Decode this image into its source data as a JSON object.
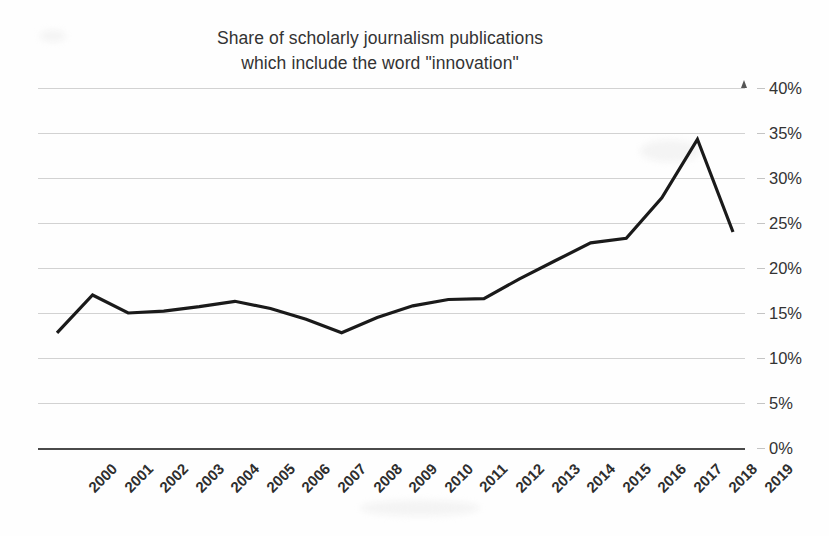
{
  "chart_data": {
    "type": "line",
    "title": "Share of scholarly journalism publications which include the word \"innovation\"",
    "title_lines": [
      "Share of scholarly journalism publications",
      "which include the word \"innovation\""
    ],
    "xlabel": "",
    "ylabel": "",
    "ylim": [
      0,
      40
    ],
    "ytick_labels": [
      "40%",
      "35%",
      "30%",
      "25%",
      "20%",
      "15%",
      "10%",
      "5%",
      "0%"
    ],
    "ytick_values": [
      40,
      35,
      30,
      25,
      20,
      15,
      10,
      5,
      0
    ],
    "grid": true,
    "y_axis_side": "right",
    "legend": null,
    "legend_position": "none",
    "line_color": "#1a1a1a",
    "grid_color": "#d2d2d2",
    "background_color": "#fefefe",
    "categories": [
      "2000",
      "2001",
      "2002",
      "2003",
      "2004",
      "2005",
      "2006",
      "2007",
      "2008",
      "2009",
      "2010",
      "2011",
      "2012",
      "2013",
      "2014",
      "2015",
      "2016",
      "2017",
      "2018",
      "2019"
    ],
    "values": [
      12.8,
      17.0,
      15.0,
      15.2,
      15.7,
      16.3,
      15.5,
      14.3,
      12.8,
      14.5,
      15.8,
      16.5,
      16.6,
      18.8,
      20.8,
      22.8,
      23.3,
      27.8,
      34.3,
      24.0
    ],
    "series": [
      {
        "name": "Share including \"innovation\"",
        "values": [
          12.8,
          17.0,
          15.0,
          15.2,
          15.7,
          16.3,
          15.5,
          14.3,
          12.8,
          14.5,
          15.8,
          16.5,
          16.6,
          18.8,
          20.8,
          22.8,
          23.3,
          27.8,
          34.3,
          24.0
        ]
      }
    ],
    "annotations": []
  }
}
